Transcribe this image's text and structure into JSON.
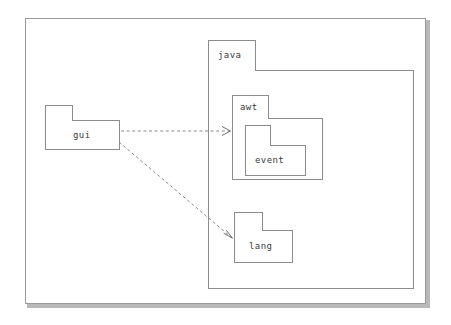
{
  "diagram": {
    "type": "uml-package-diagram",
    "title": "",
    "background_color": "#ffffff",
    "border_color": "#9a9a9a",
    "package_border_color": "#8c8c8c",
    "label_color": "#3a3a3a",
    "edge_color": "#8a8a8a"
  },
  "packages": {
    "java": {
      "name": "java",
      "kind": "package",
      "nested": true
    },
    "awt": {
      "name": "awt",
      "kind": "package",
      "parent": "java"
    },
    "event": {
      "name": "event",
      "kind": "package",
      "parent": "awt"
    },
    "lang": {
      "name": "lang",
      "kind": "package",
      "parent": "java"
    },
    "gui": {
      "name": "gui",
      "kind": "package",
      "parent": null
    }
  },
  "dependencies": [
    {
      "from": "gui",
      "to": "awt",
      "style": "dashed",
      "arrow": "open",
      "stereotype": ""
    },
    {
      "from": "gui",
      "to": "lang",
      "style": "dashed",
      "arrow": "open",
      "stereotype": ""
    }
  ]
}
